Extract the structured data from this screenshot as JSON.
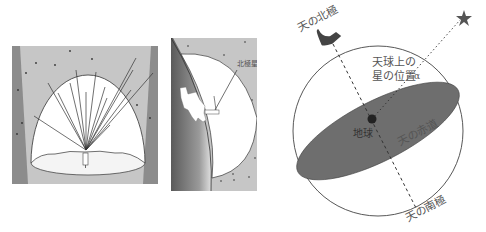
{
  "panels": {
    "dome": {
      "description": "Observer under the celestial dome with lines of sight to stars"
    },
    "earth": {
      "labels": {
        "polaris": "北極星"
      }
    },
    "celestial_sphere": {
      "labels": {
        "north_pole": "天の北極",
        "star_position_line1": "天球上の",
        "star_position_line2": "星の位置",
        "alpha": "α",
        "earth": "地球",
        "equator": "天の赤道",
        "south_pole": "天の南極"
      }
    }
  },
  "colors": {
    "sky_dark": "#8a8a8a",
    "sky_light": "#c8c8c8",
    "equator_plane": "#6e6e6e",
    "line": "#444444",
    "text": "#555555"
  }
}
